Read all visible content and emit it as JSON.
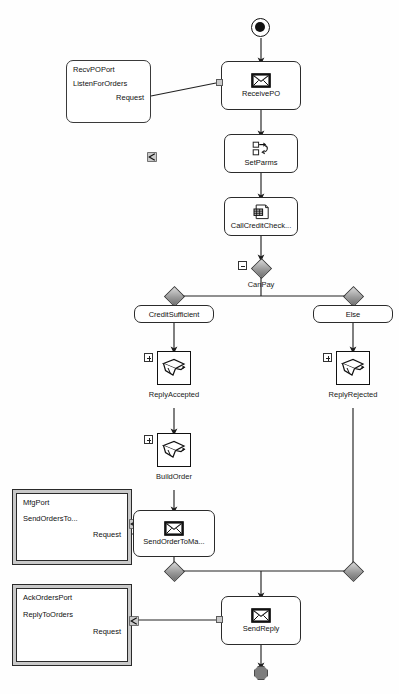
{
  "diagram": {
    "background_color": "#ffffff",
    "line_color": "#222222",
    "diamond_fill": "#9a9a9a",
    "terminal_fill": "#7d7d7d"
  },
  "terminals": {
    "start": {
      "name": "start-node"
    },
    "end": {
      "name": "end-node"
    }
  },
  "ports": [
    {
      "id": "recv-po-port",
      "style": "single",
      "port_name": "RecvPOPort",
      "operation": "ListenForOrders",
      "message": "Request"
    },
    {
      "id": "mfg-port",
      "style": "double",
      "port_name": "MfgPort",
      "operation": "SendOrdersTo...",
      "message": "Request"
    },
    {
      "id": "ack-orders-port",
      "style": "double",
      "port_name": "AckOrdersPort",
      "operation": "ReplyToOrders",
      "message": "Request"
    }
  ],
  "activities": [
    {
      "id": "receive-po",
      "label": "ReceivePO",
      "icon": "envelope-icon",
      "shape": "rounded"
    },
    {
      "id": "set-parms",
      "label": "SetParms",
      "icon": "assign-icon",
      "shape": "rounded"
    },
    {
      "id": "call-credit-check",
      "label": "CallCreditCheck...",
      "icon": "invoke-icon",
      "shape": "rounded"
    },
    {
      "id": "reply-accepted",
      "label": "ReplyAccepted",
      "icon": "scope-icon",
      "shape": "square",
      "expander": "plus"
    },
    {
      "id": "reply-rejected",
      "label": "ReplyRejected",
      "icon": "scope-icon",
      "shape": "square",
      "expander": "plus"
    },
    {
      "id": "build-order",
      "label": "BuildOrder",
      "icon": "scope-icon",
      "shape": "square",
      "expander": "plus"
    },
    {
      "id": "send-order-to-mfg",
      "label": "SendOrderToMa...",
      "icon": "envelope-icon",
      "shape": "rounded"
    },
    {
      "id": "send-reply",
      "label": "SendReply",
      "icon": "envelope-icon",
      "shape": "rounded"
    }
  ],
  "decision": {
    "id": "can-pay",
    "label": "CanPay",
    "expander": "minus",
    "branches": [
      {
        "id": "branch-credit-sufficient",
        "label": "CreditSufficient"
      },
      {
        "id": "branch-else",
        "label": "Else"
      }
    ]
  }
}
